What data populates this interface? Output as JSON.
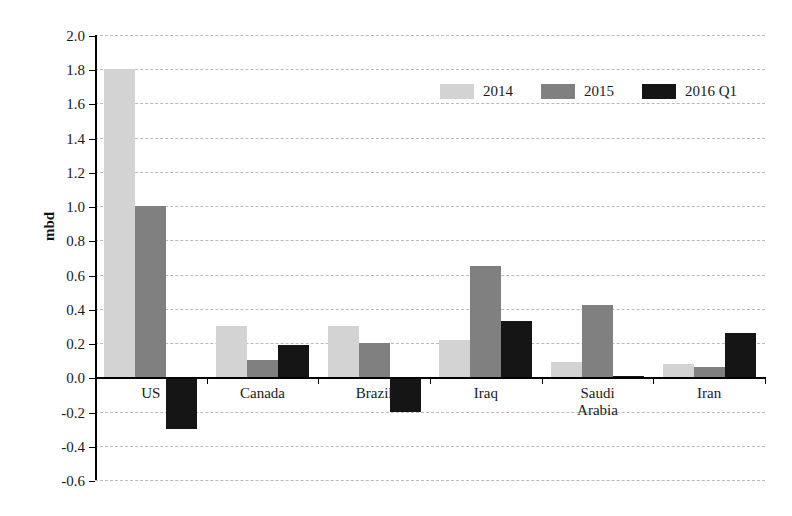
{
  "chart_data": {
    "type": "bar",
    "title": "",
    "xlabel": "",
    "ylabel": "mbd",
    "ylim": [
      -0.6,
      2.0
    ],
    "ytick_step": 0.2,
    "ytick_labels": [
      "2.0",
      "1.8",
      "1.6",
      "1.4",
      "1.2",
      "1.0",
      "0.8",
      "0.6",
      "0.4",
      "0.2",
      "0.0",
      "-0.2",
      "-0.4",
      "-0.6"
    ],
    "ytick_values": [
      2.0,
      1.8,
      1.6,
      1.4,
      1.2,
      1.0,
      0.8,
      0.6,
      0.4,
      0.2,
      0.0,
      -0.2,
      -0.4,
      -0.6
    ],
    "grid": true,
    "legend_position": "top-center",
    "categories": [
      "US",
      "Canada",
      "Brazil",
      "Iraq",
      "Saudi\nArabia",
      "Iran"
    ],
    "series": [
      {
        "name": "2014",
        "color": "#d3d3d3",
        "values": [
          1.8,
          0.3,
          0.3,
          0.22,
          0.09,
          0.08
        ]
      },
      {
        "name": "2015",
        "color": "#808080",
        "values": [
          1.0,
          0.1,
          0.2,
          0.65,
          0.42,
          0.06
        ]
      },
      {
        "name": "2016 Q1",
        "color": "#151515",
        "values": [
          -0.3,
          0.19,
          -0.2,
          0.33,
          0.01,
          0.26
        ]
      }
    ]
  },
  "legend": {
    "items": [
      {
        "label": "2014",
        "color": "#d3d3d3"
      },
      {
        "label": "2015",
        "color": "#808080"
      },
      {
        "label": "2016 Q1",
        "color": "#151515"
      }
    ]
  },
  "axes": {
    "y_title": "mbd"
  }
}
